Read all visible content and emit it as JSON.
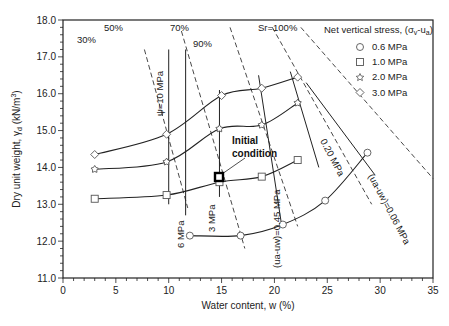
{
  "chart_data": {
    "type": "line",
    "title": "",
    "xlabel": "Water content, w (%)",
    "ylabel": "Dry unit weight, γd (kN/m³)",
    "xlim": [
      0,
      35
    ],
    "ylim": [
      11.0,
      18.0
    ],
    "x_ticks": [
      "0",
      "5",
      "10",
      "15",
      "20",
      "25",
      "30",
      "35"
    ],
    "y_ticks": [
      "11.0",
      "12.0",
      "13.0",
      "14.0",
      "15.0",
      "16.0",
      "17.0",
      "18.0"
    ],
    "grid": false,
    "legend": {
      "title": "Net vertical stress, (σv-ua)",
      "position": "upper right",
      "entries": [
        "0.6 MPa",
        "1.0 MPa",
        "2.0 MPa",
        "3.0 MPa"
      ]
    },
    "series": [
      {
        "name": "0.6 MPa",
        "marker": "circle",
        "x": [
          12.0,
          16.8,
          20.8,
          24.8,
          28.8
        ],
        "y": [
          12.15,
          12.15,
          12.45,
          13.1,
          14.4
        ]
      },
      {
        "name": "1.0 MPa",
        "marker": "square",
        "x": [
          3.0,
          9.8,
          14.8,
          18.8,
          22.2
        ],
        "y": [
          13.15,
          13.25,
          13.6,
          13.75,
          14.2
        ]
      },
      {
        "name": "2.0 MPa",
        "marker": "star",
        "x": [
          3.0,
          9.8,
          14.8,
          18.8,
          22.2
        ],
        "y": [
          13.95,
          14.15,
          15.05,
          15.15,
          15.75
        ]
      },
      {
        "name": "3.0 MPa",
        "marker": "diamond",
        "x": [
          3.0,
          9.8,
          15.0,
          18.8,
          22.2
        ],
        "y": [
          14.35,
          14.9,
          15.95,
          16.15,
          16.45
        ]
      }
    ],
    "initial_condition": {
      "label": "Initial condition",
      "x": 14.8,
      "y": 13.74
    },
    "saturation_lines": [
      {
        "label": "30%",
        "from": [
          7.7,
          17.2
        ],
        "to": [
          11.8,
          12.9
        ]
      },
      {
        "label": "50%",
        "from": [
          11.2,
          17.7
        ],
        "to": [
          17.2,
          11.8
        ]
      },
      {
        "label": "70%",
        "from": [
          15.8,
          17.8
        ],
        "to": [
          22.2,
          12.4
        ]
      },
      {
        "label": "90%",
        "from": [
          19.8,
          17.8
        ],
        "to": [
          29.2,
          13.0
        ]
      },
      {
        "label": "Sr=100%",
        "from": [
          22.5,
          17.8
        ],
        "to": [
          35.0,
          13.7
        ]
      }
    ],
    "suction_lines": [
      {
        "label": "ψ=10 MPa",
        "from": [
          10.0,
          17.2
        ],
        "to": [
          10.0,
          13.0
        ]
      },
      {
        "label": "6 MPa",
        "from": [
          11.6,
          17.2
        ],
        "to": [
          11.6,
          12.7
        ]
      },
      {
        "label": "3 MPa",
        "from": [
          14.8,
          16.1
        ],
        "to": [
          14.8,
          13.2
        ]
      },
      {
        "label": "(ua-uw)=0.45 MPa",
        "from": [
          18.5,
          16.5
        ],
        "to": [
          20.7,
          12.4
        ]
      },
      {
        "label": "0.20 MPa",
        "from": [
          21.5,
          16.6
        ],
        "to": [
          24.2,
          14.0
        ]
      },
      {
        "label": "(ua-uw)=0.06 MPa",
        "from": [
          23.0,
          16.3
        ],
        "to": [
          29.5,
          13.8
        ]
      }
    ]
  },
  "labels": {
    "xlabel": "Water content, w (%)",
    "ylabel": "Dry unit weight, γd (kN/m³)",
    "legend_title": "Net vertical stress, (σv-ua)",
    "legend": [
      "0.6 MPa",
      "1.0 MPa",
      "2.0 MPa",
      "3.0 MPa"
    ],
    "initial_1": "Initial",
    "initial_2": "condition",
    "sr30": "30%",
    "sr50": "50%",
    "sr70": "70%",
    "sr90": "90%",
    "sr100": "Sr=100%",
    "psi10": "ψ=10 MPa",
    "psi6": "6 MPa",
    "psi3": "3 MPa",
    "psi045": "(ua-uw)=0.45 MPa",
    "psi020": "0.20 MPa",
    "psi006": "(ua-uw)=0.06 MPa",
    "x_ticks": [
      "0",
      "5",
      "10",
      "15",
      "20",
      "25",
      "30",
      "35"
    ],
    "y_ticks": [
      "11.0",
      "12.0",
      "13.0",
      "14.0",
      "15.0",
      "16.0",
      "17.0",
      "18.0"
    ]
  }
}
